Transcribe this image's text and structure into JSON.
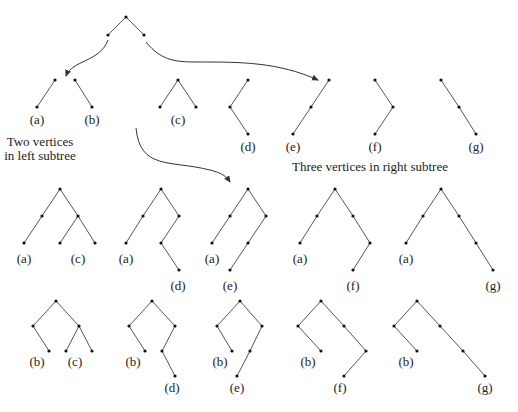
{
  "captions": {
    "left": [
      "Two vertices",
      "in left subtree"
    ],
    "right": "Three vertices in right subtree"
  },
  "colors": {
    "edge": "#555555",
    "node": "#111111",
    "text": "#222222"
  },
  "root_tree": {
    "nodes": [
      [
        126,
        17
      ],
      [
        108,
        35
      ],
      [
        144,
        35
      ]
    ],
    "edges": [
      [
        0,
        1
      ],
      [
        0,
        2
      ]
    ]
  },
  "arrows": [
    {
      "name": "arrow-to-left-subtrees",
      "d": "M108,40 C100,62 72,60 66,76",
      "head": [
        66,
        78
      ]
    },
    {
      "name": "arrow-to-right-subtrees",
      "d": "M146,42 C162,62 178,62 200,62 C240,62 278,62 318,80",
      "head": [
        320,
        81
      ]
    },
    {
      "name": "arrow-to-combined-row",
      "d": "M136,128 C140,170 170,160 210,170 C222,173 226,176 230,182",
      "head": [
        231,
        184
      ]
    }
  ],
  "left_subtrees": [
    {
      "label": "(a)",
      "label_pos": [
        37,
        124
      ],
      "nodes": [
        [
          55,
          80
        ],
        [
          37,
          107
        ]
      ],
      "edges": [
        [
          0,
          1
        ]
      ]
    },
    {
      "label": "(b)",
      "label_pos": [
        92,
        124
      ],
      "nodes": [
        [
          75,
          80
        ],
        [
          92,
          107
        ]
      ],
      "edges": [
        [
          0,
          1
        ]
      ]
    }
  ],
  "right_subtrees": [
    {
      "label": "(c)",
      "label_pos": [
        178,
        124
      ],
      "nodes": [
        [
          178,
          80
        ],
        [
          160,
          107
        ],
        [
          196,
          107
        ]
      ],
      "edges": [
        [
          0,
          1
        ],
        [
          0,
          2
        ]
      ]
    },
    {
      "label": "(d)",
      "label_pos": [
        248,
        151
      ],
      "nodes": [
        [
          248,
          80
        ],
        [
          230,
          107
        ],
        [
          248,
          134
        ]
      ],
      "edges": [
        [
          0,
          1
        ],
        [
          1,
          2
        ]
      ]
    },
    {
      "label": "(e)",
      "label_pos": [
        293,
        151
      ],
      "nodes": [
        [
          329,
          80
        ],
        [
          311,
          107
        ],
        [
          293,
          134
        ]
      ],
      "edges": [
        [
          0,
          1
        ],
        [
          1,
          2
        ]
      ]
    },
    {
      "label": "(f)",
      "label_pos": [
        375,
        151
      ],
      "nodes": [
        [
          375,
          80
        ],
        [
          393,
          107
        ],
        [
          375,
          134
        ]
      ],
      "edges": [
        [
          0,
          1
        ],
        [
          1,
          2
        ]
      ]
    },
    {
      "label": "(g)",
      "label_pos": [
        476,
        151
      ],
      "nodes": [
        [
          441,
          80
        ],
        [
          459,
          107
        ],
        [
          476,
          134
        ]
      ],
      "edges": [
        [
          0,
          1
        ],
        [
          1,
          2
        ]
      ]
    }
  ],
  "row1": [
    {
      "labels": [
        [
          "(a)",
          24,
          263
        ],
        [
          "(c)",
          78,
          263
        ]
      ],
      "nodes": [
        [
          60,
          189
        ],
        [
          42,
          216
        ],
        [
          24,
          243
        ],
        [
          78,
          216
        ],
        [
          60,
          243
        ],
        [
          95,
          243
        ]
      ],
      "edges": [
        [
          0,
          1
        ],
        [
          1,
          2
        ],
        [
          0,
          3
        ],
        [
          3,
          4
        ],
        [
          3,
          5
        ]
      ]
    },
    {
      "labels": [
        [
          "(a)",
          126,
          263
        ],
        [
          "(d)",
          178,
          290
        ]
      ],
      "nodes": [
        [
          161,
          189
        ],
        [
          143,
          216
        ],
        [
          126,
          243
        ],
        [
          179,
          216
        ],
        [
          161,
          243
        ],
        [
          179,
          270
        ]
      ],
      "edges": [
        [
          0,
          1
        ],
        [
          1,
          2
        ],
        [
          0,
          3
        ],
        [
          3,
          4
        ],
        [
          4,
          5
        ]
      ]
    },
    {
      "labels": [
        [
          "(a)",
          212,
          263
        ],
        [
          "(e)",
          230,
          290
        ]
      ],
      "nodes": [
        [
          248,
          189
        ],
        [
          230,
          216
        ],
        [
          212,
          243
        ],
        [
          266,
          216
        ],
        [
          248,
          243
        ],
        [
          230,
          270
        ]
      ],
      "edges": [
        [
          0,
          1
        ],
        [
          1,
          2
        ],
        [
          0,
          3
        ],
        [
          3,
          4
        ],
        [
          4,
          5
        ]
      ]
    },
    {
      "labels": [
        [
          "(a)",
          300,
          263
        ],
        [
          "(f)",
          353,
          290
        ]
      ],
      "nodes": [
        [
          335,
          189
        ],
        [
          317,
          216
        ],
        [
          300,
          243
        ],
        [
          353,
          216
        ],
        [
          370,
          243
        ],
        [
          353,
          270
        ]
      ],
      "edges": [
        [
          0,
          1
        ],
        [
          1,
          2
        ],
        [
          0,
          3
        ],
        [
          3,
          4
        ],
        [
          4,
          5
        ]
      ]
    },
    {
      "labels": [
        [
          "(a)",
          406,
          263
        ],
        [
          "(g)",
          493,
          290
        ]
      ],
      "nodes": [
        [
          441,
          189
        ],
        [
          423,
          216
        ],
        [
          406,
          243
        ],
        [
          459,
          216
        ],
        [
          476,
          243
        ],
        [
          493,
          270
        ]
      ],
      "edges": [
        [
          0,
          1
        ],
        [
          1,
          2
        ],
        [
          0,
          3
        ],
        [
          3,
          4
        ],
        [
          4,
          5
        ]
      ]
    }
  ],
  "row2": [
    {
      "labels": [
        [
          "(b)",
          37,
          366
        ],
        [
          "(c)",
          75,
          366
        ]
      ],
      "nodes": [
        [
          56,
          301
        ],
        [
          33,
          326
        ],
        [
          49,
          351
        ],
        [
          79,
          326
        ],
        [
          66,
          351
        ],
        [
          92,
          351
        ]
      ],
      "edges": [
        [
          0,
          1
        ],
        [
          1,
          2
        ],
        [
          0,
          3
        ],
        [
          3,
          4
        ],
        [
          3,
          5
        ]
      ]
    },
    {
      "labels": [
        [
          "(b)",
          133,
          366
        ],
        [
          "(d)",
          172,
          392
        ]
      ],
      "nodes": [
        [
          152,
          301
        ],
        [
          129,
          326
        ],
        [
          145,
          351
        ],
        [
          175,
          326
        ],
        [
          162,
          351
        ],
        [
          175,
          376
        ]
      ],
      "edges": [
        [
          0,
          1
        ],
        [
          1,
          2
        ],
        [
          0,
          3
        ],
        [
          3,
          4
        ],
        [
          4,
          5
        ]
      ]
    },
    {
      "labels": [
        [
          "(b)",
          220,
          366
        ],
        [
          "(e)",
          237,
          392
        ]
      ],
      "nodes": [
        [
          240,
          301
        ],
        [
          217,
          326
        ],
        [
          232,
          351
        ],
        [
          262,
          326
        ],
        [
          250,
          351
        ],
        [
          237,
          376
        ]
      ],
      "edges": [
        [
          0,
          1
        ],
        [
          1,
          2
        ],
        [
          0,
          3
        ],
        [
          3,
          4
        ],
        [
          4,
          5
        ]
      ]
    },
    {
      "labels": [
        [
          "(b)",
          308,
          366
        ],
        [
          "(f)",
          340,
          392
        ]
      ],
      "nodes": [
        [
          321,
          301
        ],
        [
          298,
          326
        ],
        [
          321,
          351
        ],
        [
          344,
          326
        ],
        [
          366,
          351
        ],
        [
          344,
          376
        ]
      ],
      "edges": [
        [
          0,
          1
        ],
        [
          1,
          2
        ],
        [
          0,
          3
        ],
        [
          3,
          4
        ],
        [
          4,
          5
        ]
      ]
    },
    {
      "labels": [
        [
          "(b)",
          406,
          366
        ],
        [
          "(g)",
          485,
          392
        ]
      ],
      "nodes": [
        [
          417,
          301
        ],
        [
          394,
          326
        ],
        [
          417,
          351
        ],
        [
          440,
          326
        ],
        [
          463,
          351
        ],
        [
          485,
          376
        ]
      ],
      "edges": [
        [
          0,
          1
        ],
        [
          1,
          2
        ],
        [
          0,
          3
        ],
        [
          3,
          4
        ],
        [
          4,
          5
        ]
      ]
    }
  ]
}
